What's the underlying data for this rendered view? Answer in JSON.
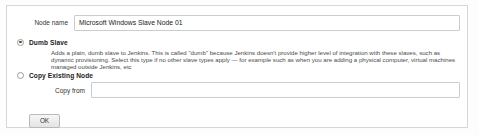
{
  "panel": {
    "node_name": {
      "label": "Node name",
      "value": "Microsoft Windows Slave Node 01",
      "placeholder": ""
    },
    "options": [
      {
        "id": "dumb-slave",
        "label": "Dumb Slave",
        "selected": true,
        "description": "Adds a plain, dumb slave to Jenkins. This is called \"dumb\" because Jenkins doesn't provide higher level of integration with these slaves, such as dynamic provisioning. Select this type if no other slave types apply — for example such as when you are adding a physical computer, virtual machines managed outside Jenkins, etc"
      },
      {
        "id": "copy-existing-node",
        "label": "Copy Existing Node",
        "selected": false,
        "description": ""
      }
    ],
    "copy_from": {
      "label": "Copy from",
      "value": "",
      "placeholder": ""
    },
    "buttons": {
      "ok_label": "OK"
    }
  },
  "colors": {
    "page_background": "#fdfdfd",
    "panel_background": "#ffffff",
    "panel_border": "#d6d6d6",
    "input_border": "#cccccc",
    "text_primary": "#222222",
    "text_secondary": "#4a4a4a",
    "radio_selected": "#4a4a4a"
  }
}
